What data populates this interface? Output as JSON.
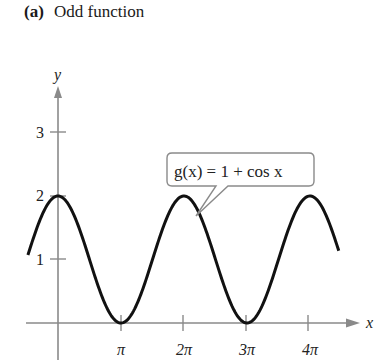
{
  "figure": {
    "label": "(a)",
    "title": "Odd function"
  },
  "callout": {
    "text": "g(x) = 1 + cos x"
  },
  "colors": {
    "axis": "#8a8a8a",
    "curve": "#111111",
    "text": "#222222"
  },
  "chart_data": {
    "type": "line",
    "title": "(a) Odd function",
    "xlabel": "x",
    "ylabel": "y",
    "x_ticks": [
      "π",
      "2π",
      "3π",
      "4π"
    ],
    "x_tick_values": [
      3.1416,
      6.2832,
      9.4248,
      12.5664
    ],
    "y_ticks": [
      "1",
      "2",
      "3"
    ],
    "y_tick_values": [
      1,
      2,
      3
    ],
    "xlim": [
      -0.5,
      14.5
    ],
    "ylim": [
      -0.6,
      3.6
    ],
    "grid": false,
    "legend": null,
    "annotations": [
      {
        "text": "g(x) = 1 + cos x",
        "points_to_x": 7.3
      }
    ],
    "series": [
      {
        "name": "g(x) = 1 + cos x",
        "function": "1 + cos(x)",
        "x_range": [
          -1.5,
          14.0
        ],
        "x": [
          -1.5,
          0,
          1.5708,
          3.1416,
          4.7124,
          6.2832,
          7.854,
          9.4248,
          10.9956,
          12.5664,
          14.0
        ],
        "values": [
          1.07,
          2,
          1,
          0,
          1,
          2,
          1,
          0,
          1,
          2,
          1.14
        ]
      }
    ]
  }
}
